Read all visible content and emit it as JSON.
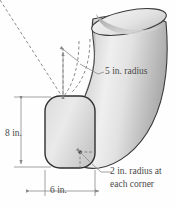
{
  "figure": {
    "name": "duct-elbow-diagram",
    "background_color": "#fefefe",
    "outline_color": "#3a3a3a",
    "shade_light": "#ededed",
    "shade_mid": "#cfcfcf",
    "shade_dark": "#b3b3b3",
    "dimension_line_color": "#8a8a8a",
    "text_color": "#4a4a4a"
  },
  "labels": {
    "bend_radius": "5 in. radius",
    "height": "8 in.",
    "width": "6 in.",
    "corner_radius_line1": "2 in. radius at",
    "corner_radius_line2": "each corner"
  },
  "dimensions": {
    "height_value": 8,
    "height_unit": "in.",
    "width_value": 6,
    "width_unit": "in.",
    "bend_radius_value": 5,
    "bend_radius_unit": "in.",
    "corner_radius_value": 2,
    "corner_radius_unit": "in."
  }
}
